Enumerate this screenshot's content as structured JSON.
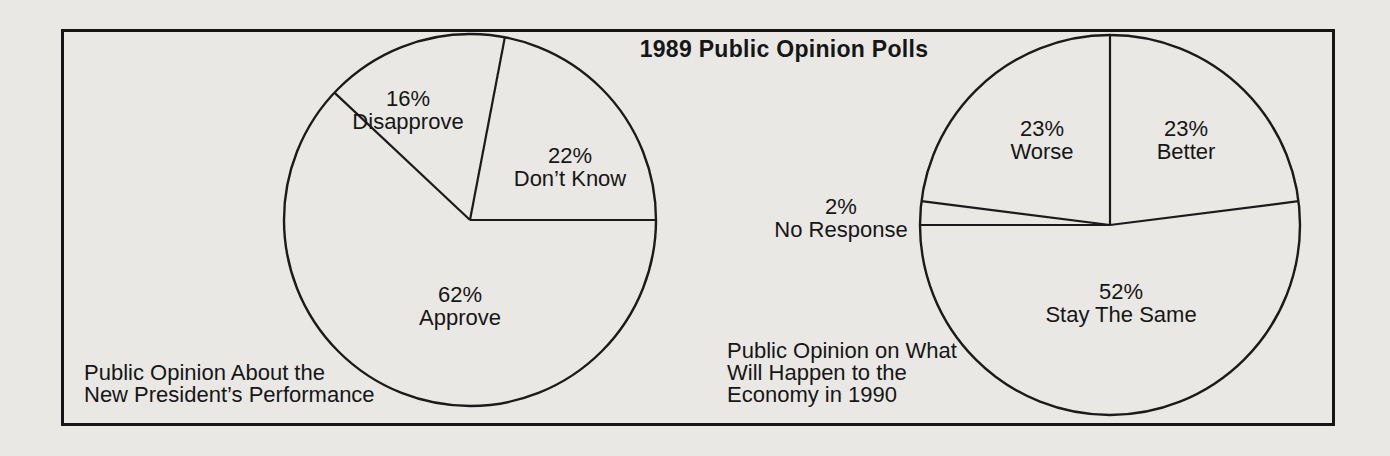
{
  "colors": {
    "background": "#e9e8e4",
    "line": "#1b1b1b",
    "text": "#161616"
  },
  "title": "1989 Public Opinion Polls",
  "chart_data": [
    {
      "type": "pie",
      "name": "president-performance-pie",
      "caption_lines": [
        "Public Opinion About the",
        "New President’s Performance"
      ],
      "center": {
        "x": 470,
        "y": 220
      },
      "radius": 186,
      "start_angle_deg": 0,
      "direction": "ccw",
      "slices": [
        {
          "label": "Don’t Know",
          "value": 22,
          "pct_label": "22%"
        },
        {
          "label": "Disapprove",
          "value": 16,
          "pct_label": "16%"
        },
        {
          "label": "Approve",
          "value": 62,
          "pct_label": "62%"
        }
      ]
    },
    {
      "type": "pie",
      "name": "economy-1990-pie",
      "caption_lines": [
        "Public Opinion on What",
        "Will Happen to the",
        "Economy in 1990"
      ],
      "center": {
        "x": 1110,
        "y": 225
      },
      "radius": 190,
      "start_angle_deg": 90,
      "direction": "cw",
      "slices": [
        {
          "label": "Better",
          "value": 23,
          "pct_label": "23%"
        },
        {
          "label": "Stay The Same",
          "value": 52,
          "pct_label": "52%"
        },
        {
          "label": "No Response",
          "value": 2,
          "pct_label": "2%"
        },
        {
          "label": "Worse",
          "value": 23,
          "pct_label": "23%"
        }
      ]
    }
  ]
}
